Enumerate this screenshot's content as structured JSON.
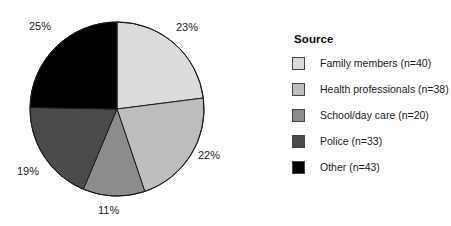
{
  "chart_data": {
    "type": "pie",
    "title": "",
    "legend_title": "Source",
    "legend_position": "right",
    "categories": [
      "Family members (n=40)",
      "Health professionals (n=38)",
      "School/day care (n=20)",
      "Police (n=33)",
      "Other (n=43)"
    ],
    "values": [
      40,
      38,
      20,
      33,
      43
    ],
    "total": 174,
    "percent_labels": [
      "23%",
      "22%",
      "11%",
      "19%",
      "25%"
    ],
    "percentages": [
      23,
      22,
      11,
      19,
      25
    ],
    "colors": [
      "#dcdcdc",
      "#bdbdbd",
      "#8c8c8c",
      "#4a4a4a",
      "#000000"
    ],
    "slice_order": "clockwise from 12 o'clock",
    "slice_edge_color": "#1a1a1a"
  },
  "pie": {
    "center_x": 117,
    "center_y": 109,
    "radius": 87,
    "slices": [
      {
        "name": "family-members",
        "value": 40,
        "percent_label": "23%",
        "color": "#dcdcdc",
        "label_x": 176,
        "label_y": 22
      },
      {
        "name": "health-professionals",
        "value": 38,
        "percent_label": "22%",
        "color": "#bdbdbd",
        "label_x": 198,
        "label_y": 150
      },
      {
        "name": "school-day-care",
        "value": 20,
        "percent_label": "11%",
        "color": "#8c8c8c",
        "label_x": 98,
        "label_y": 205
      },
      {
        "name": "police",
        "value": 33,
        "percent_label": "19%",
        "color": "#4a4a4a",
        "label_x": 17,
        "label_y": 166
      },
      {
        "name": "other",
        "value": 43,
        "percent_label": "25%",
        "color": "#000000",
        "label_x": 29,
        "label_y": 21
      }
    ]
  },
  "legend": {
    "title": "Source",
    "items": [
      {
        "label": "Family members (n=40)",
        "color": "#dcdcdc"
      },
      {
        "label": "Health professionals (n=38)",
        "color": "#bdbdbd"
      },
      {
        "label": "School/day care (n=20)",
        "color": "#8c8c8c"
      },
      {
        "label": "Police (n=33)",
        "color": "#4a4a4a"
      },
      {
        "label": "Other (n=43)",
        "color": "#000000"
      }
    ]
  }
}
